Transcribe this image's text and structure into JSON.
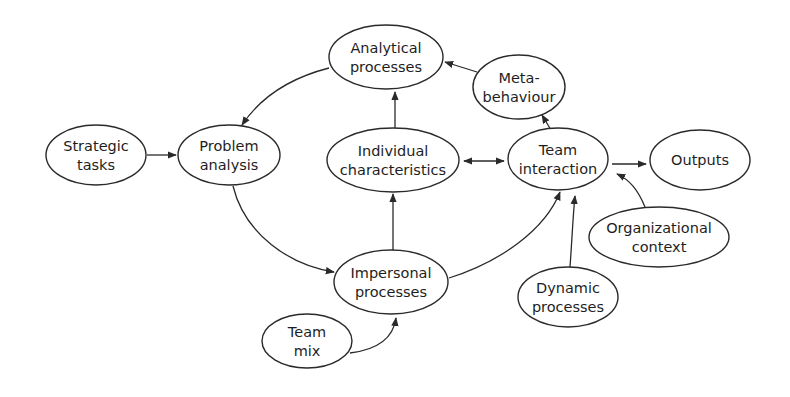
{
  "diagram": {
    "type": "flow-diagram",
    "nodes": [
      {
        "id": "strategic_tasks",
        "lines": [
          "Strategic",
          "tasks"
        ],
        "cx": 96,
        "cy": 155,
        "rx": 50,
        "ry": 30
      },
      {
        "id": "problem_analysis",
        "lines": [
          "Problem",
          "analysis"
        ],
        "cx": 229,
        "cy": 155,
        "rx": 51,
        "ry": 30
      },
      {
        "id": "analytical_processes",
        "lines": [
          "Analytical",
          "processes"
        ],
        "cx": 386,
        "cy": 57,
        "rx": 57,
        "ry": 32
      },
      {
        "id": "meta_behaviour",
        "lines": [
          "Meta-",
          "behaviour"
        ],
        "cx": 519,
        "cy": 87,
        "rx": 46,
        "ry": 32
      },
      {
        "id": "individual_characteristics",
        "lines": [
          "Individual",
          "characteristics"
        ],
        "cx": 393,
        "cy": 160,
        "rx": 66,
        "ry": 32
      },
      {
        "id": "team_interaction",
        "lines": [
          "Team",
          "interaction"
        ],
        "cx": 558,
        "cy": 159,
        "rx": 50,
        "ry": 31
      },
      {
        "id": "outputs",
        "lines": [
          "Outputs"
        ],
        "cx": 700,
        "cy": 160,
        "rx": 50,
        "ry": 30
      },
      {
        "id": "impersonal_processes",
        "lines": [
          "Impersonal",
          "processes"
        ],
        "cx": 391,
        "cy": 282,
        "rx": 57,
        "ry": 32
      },
      {
        "id": "team_mix",
        "lines": [
          "Team",
          "mix"
        ],
        "cx": 307,
        "cy": 341,
        "rx": 45,
        "ry": 27
      },
      {
        "id": "dynamic_processes",
        "lines": [
          "Dynamic",
          "processes"
        ],
        "cx": 568,
        "cy": 297,
        "rx": 50,
        "ry": 30
      },
      {
        "id": "organizational_context",
        "lines": [
          "Organizational",
          "context"
        ],
        "cx": 659,
        "cy": 237,
        "rx": 70,
        "ry": 30
      }
    ],
    "edges": [
      {
        "from": "strategic_tasks",
        "to": "problem_analysis",
        "d": "M147,155 L176,155",
        "end": true,
        "start": false
      },
      {
        "from": "analytical_processes",
        "to": "problem_analysis",
        "d": "M329,68 C290,78 260,98 242,125",
        "end": true,
        "start": false
      },
      {
        "from": "problem_analysis",
        "to": "impersonal_processes",
        "d": "M233,186 C245,235 290,265 334,272",
        "end": true,
        "start": false
      },
      {
        "from": "impersonal_processes",
        "to": "individual_characteristics",
        "d": "M393,250 L393,194",
        "end": true,
        "start": false
      },
      {
        "from": "individual_characteristics",
        "to": "analytical_processes",
        "d": "M395,128 L395,92",
        "end": true,
        "start": false
      },
      {
        "from": "individual_characteristics",
        "to": "team_interaction",
        "d": "M464,161 L504,161",
        "end": true,
        "start": true
      },
      {
        "from": "impersonal_processes",
        "to": "team_interaction",
        "d": "M449,278 C500,262 545,230 560,192",
        "end": true,
        "start": false
      },
      {
        "from": "team_interaction",
        "to": "meta_behaviour",
        "d": "M551,130 L542,115",
        "end": true,
        "start": false
      },
      {
        "from": "meta_behaviour",
        "to": "analytical_processes",
        "d": "M477,72 L445,62",
        "end": true,
        "start": false
      },
      {
        "from": "team_interaction",
        "to": "outputs",
        "d": "M612,164 L646,164",
        "end": true,
        "start": false
      },
      {
        "from": "dynamic_processes",
        "to": "team_interaction",
        "d": "M570,267 C572,240 573,215 575,196",
        "end": true,
        "start": false
      },
      {
        "from": "organizational_context",
        "to": "team_interaction",
        "d": "M645,207 C638,190 630,180 617,174",
        "end": true,
        "start": false
      },
      {
        "from": "team_mix",
        "to": "impersonal_processes",
        "d": "M350,353 C375,350 393,340 396,318",
        "end": true,
        "start": false
      }
    ]
  }
}
